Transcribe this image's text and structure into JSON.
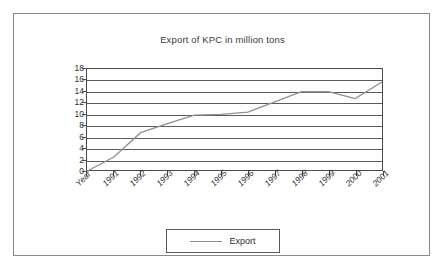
{
  "chart_data": {
    "type": "line",
    "title": "Export of KPC in million tons",
    "xlabel": "",
    "ylabel": "",
    "categories": [
      "Year",
      "1991",
      "1992",
      "1993",
      "1994",
      "1995",
      "1996",
      "1997",
      "1998",
      "1999",
      "2000",
      "2001"
    ],
    "series": [
      {
        "name": "Export",
        "values": [
          0,
          2.5,
          6.8,
          8.4,
          9.9,
          10.0,
          10.4,
          12.2,
          14.0,
          14.0,
          12.8,
          15.7
        ]
      }
    ],
    "ylim": [
      0,
      18
    ],
    "ytick_step": 2,
    "yticks": [
      18,
      16,
      14,
      12,
      10,
      8,
      6,
      4,
      2,
      0
    ],
    "grid": "horizontal",
    "legend_position": "bottom-center",
    "line_color": "#8f8f8f",
    "axis_color": "#4a4a4a",
    "grid_color": "#5a5a5a",
    "background_color": "#ffffff"
  },
  "legend": {
    "entries": [
      {
        "label": "Export",
        "swatch": "line-swatch"
      }
    ]
  },
  "frame": {
    "border_color": "#8a8a8a"
  }
}
